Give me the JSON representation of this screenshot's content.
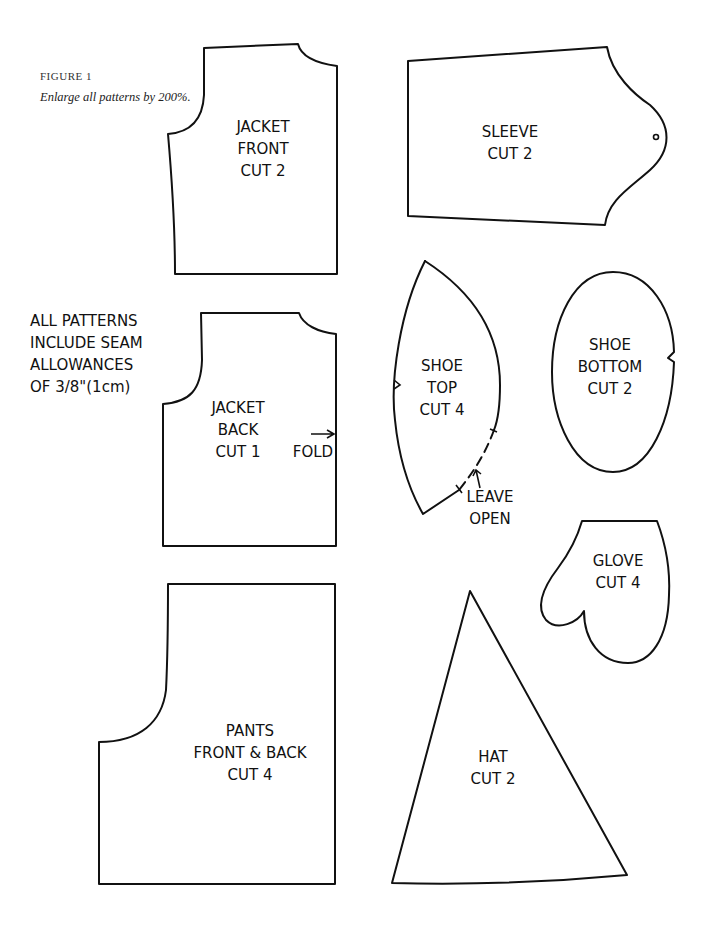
{
  "figure": {
    "label": "FIGURE 1",
    "caption": "Enlarge all patterns by 200%."
  },
  "note": {
    "lines": [
      "ALL PATTERNS",
      "INCLUDE SEAM",
      "ALLOWANCES",
      "OF 3/8\"(1cm)"
    ]
  },
  "patterns": {
    "jacket_front": {
      "lines": [
        "JACKET",
        "FRONT",
        "CUT 2"
      ]
    },
    "sleeve": {
      "lines": [
        "SLEEVE",
        "CUT 2"
      ]
    },
    "jacket_back": {
      "lines": [
        "JACKET",
        "BACK",
        "CUT 1"
      ],
      "fold_label": "FOLD"
    },
    "shoe_top": {
      "lines": [
        "SHOE",
        "TOP",
        "CUT 4"
      ],
      "annotation": [
        "LEAVE",
        "OPEN"
      ]
    },
    "shoe_bottom": {
      "lines": [
        "SHOE",
        "BOTTOM",
        "CUT 2"
      ]
    },
    "glove": {
      "lines": [
        "GLOVE",
        "CUT 4"
      ]
    },
    "pants": {
      "lines": [
        "PANTS",
        "FRONT & BACK",
        "CUT 4"
      ]
    },
    "hat": {
      "lines": [
        "HAT",
        "CUT 2"
      ]
    }
  }
}
